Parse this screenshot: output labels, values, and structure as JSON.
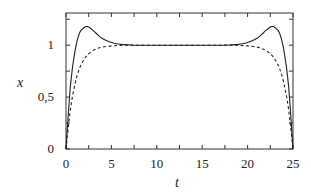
{
  "chart_data": {
    "type": "line",
    "title": "",
    "xlabel": "t",
    "ylabel": "x",
    "xlim": [
      0,
      25
    ],
    "ylim": [
      0,
      1.31
    ],
    "grid": false,
    "legend": null,
    "x_ticks": [
      0,
      5,
      10,
      15,
      20,
      25
    ],
    "x_tick_labels": [
      "0",
      "5",
      "10",
      "15",
      "20",
      "25"
    ],
    "x_minor_ticks": [
      2.5,
      7.5,
      12.5,
      17.5,
      22.5
    ],
    "y_ticks": [
      0,
      0.5,
      1
    ],
    "y_tick_labels": [
      "0",
      "0,5",
      "1"
    ],
    "y_minor_ticks": [
      0.25,
      0.75,
      1.25
    ],
    "x": [
      0,
      0.5,
      1,
      1.5,
      2,
      2.3,
      2.5,
      3,
      3.5,
      4,
      5,
      6,
      7,
      8,
      10,
      12.5,
      15,
      17,
      18,
      19,
      20,
      21,
      21.5,
      22,
      22.5,
      22.7,
      23,
      23.5,
      24,
      24.5,
      25
    ],
    "series": [
      {
        "name": "solid",
        "style": "solid",
        "values": [
          0,
          0.62,
          0.95,
          1.12,
          1.17,
          1.18,
          1.175,
          1.14,
          1.1,
          1.065,
          1.025,
          1.008,
          1.002,
          1.0,
          1.0,
          1.0,
          1.0,
          1.0,
          1.002,
          1.008,
          1.025,
          1.065,
          1.1,
          1.14,
          1.175,
          1.18,
          1.17,
          1.12,
          0.95,
          0.62,
          0
        ]
      },
      {
        "name": "dashed",
        "style": "dashed",
        "values": [
          0,
          0.39,
          0.63,
          0.78,
          0.865,
          0.9,
          0.918,
          0.95,
          0.97,
          0.982,
          0.993,
          0.998,
          1.0,
          1.0,
          1.0,
          1.0,
          1.0,
          1.0,
          1.0,
          0.998,
          0.993,
          0.982,
          0.97,
          0.95,
          0.918,
          0.9,
          0.865,
          0.78,
          0.63,
          0.39,
          0
        ]
      }
    ]
  },
  "plot_box": {
    "left": 66,
    "top": 13,
    "right": 293,
    "bottom": 149
  },
  "colors": {
    "line": "#222222",
    "axis": "#333333"
  }
}
